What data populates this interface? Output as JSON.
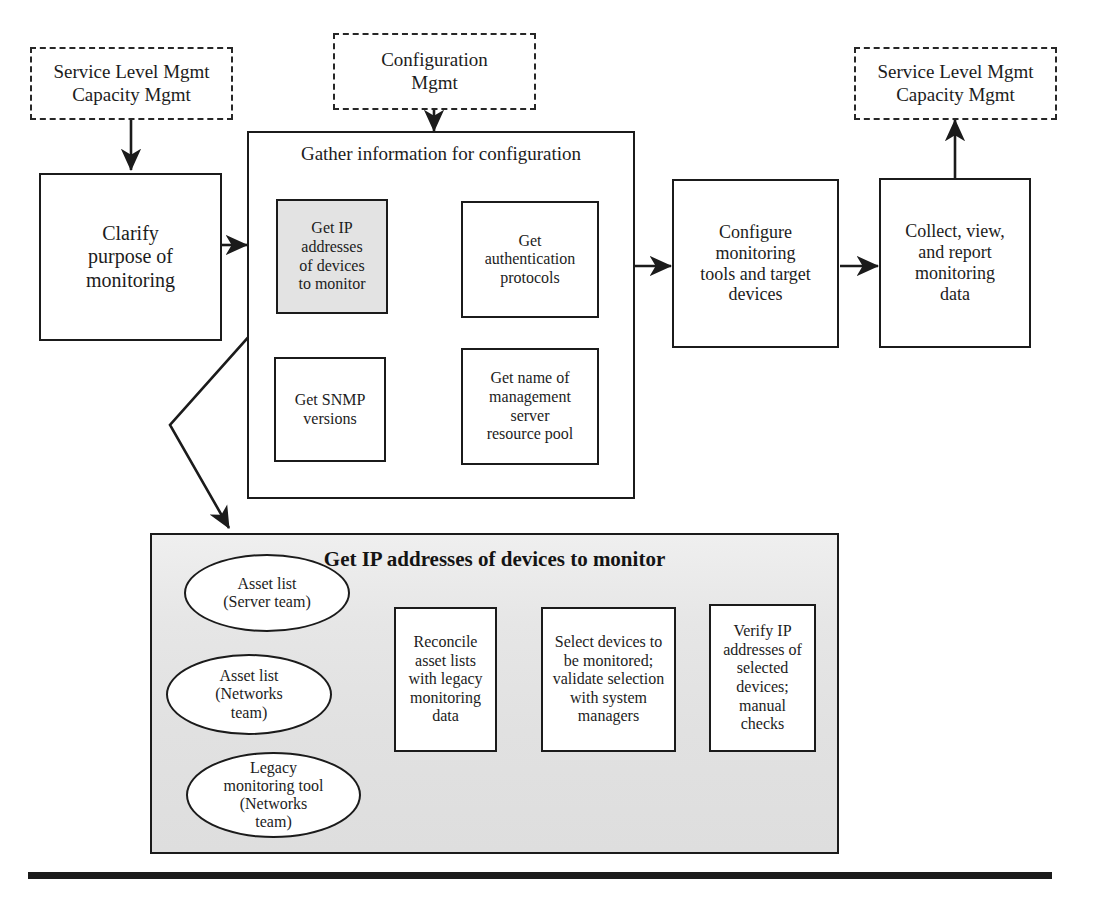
{
  "diagram": {
    "background": "#ffffff",
    "line_color": "#1b1b1b",
    "shaded_fill": "#e3e3e3",
    "subdiagram_fill": "#e2e2e2"
  },
  "top_inputs": {
    "left": {
      "line1": "Service Level Mgmt",
      "line2": "Capacity Mgmt"
    },
    "middle": {
      "line1": "Configuration",
      "line2": "Mgmt"
    },
    "right": {
      "line1": "Service Level Mgmt",
      "line2": "Capacity Mgmt"
    }
  },
  "main_flow": {
    "clarify": {
      "line1": "Clarify",
      "line2": "purpose of",
      "line3": "monitoring"
    },
    "gather_container": {
      "title": "Gather information for configuration",
      "items": [
        {
          "id": "get-ip-addresses",
          "highlighted": true,
          "line1": "Get IP",
          "line2": "addresses",
          "line3": "of devices",
          "line4": "to monitor"
        },
        {
          "id": "get-authentication-protocols",
          "highlighted": false,
          "line1": "Get",
          "line2": "authentication",
          "line3": "protocols"
        },
        {
          "id": "get-snmp-versions",
          "highlighted": false,
          "line1": "Get SNMP",
          "line2": "versions"
        },
        {
          "id": "get-name-of-management-server-resource-pool",
          "highlighted": false,
          "line1": "Get name of",
          "line2": "management",
          "line3": "server",
          "line4": "resource pool"
        }
      ]
    },
    "configure": {
      "line1": "Configure",
      "line2": "monitoring",
      "line3": "tools and target",
      "line4": "devices"
    },
    "collect": {
      "line1": "Collect, view,",
      "line2": "and report",
      "line3": "monitoring",
      "line4": "data"
    }
  },
  "subdiagram": {
    "title": "Get IP addresses of devices to monitor",
    "sources": [
      {
        "id": "asset-list-server-team",
        "line1": "Asset list",
        "line2": "(Server team)"
      },
      {
        "id": "asset-list-networks-team",
        "line1": "Asset list",
        "line2": "(Networks",
        "line3": "team)"
      },
      {
        "id": "legacy-monitoring-tool-networks-team",
        "line1": "Legacy",
        "line2": "monitoring tool",
        "line3": "(Networks",
        "line4": "team)"
      }
    ],
    "steps": [
      {
        "id": "reconcile-asset-lists",
        "line1": "Reconcile",
        "line2": "asset lists",
        "line3": "with legacy",
        "line4": "monitoring",
        "line5": "data"
      },
      {
        "id": "select-devices",
        "line1": "Select devices to",
        "line2": "be monitored;",
        "line3": "validate selection",
        "line4": "with system",
        "line5": "managers"
      },
      {
        "id": "verify-ip-addresses",
        "line1": "Verify IP",
        "line2": "addresses of",
        "line3": "selected",
        "line4": "devices;",
        "line5": "manual",
        "line6": "checks"
      }
    ]
  }
}
